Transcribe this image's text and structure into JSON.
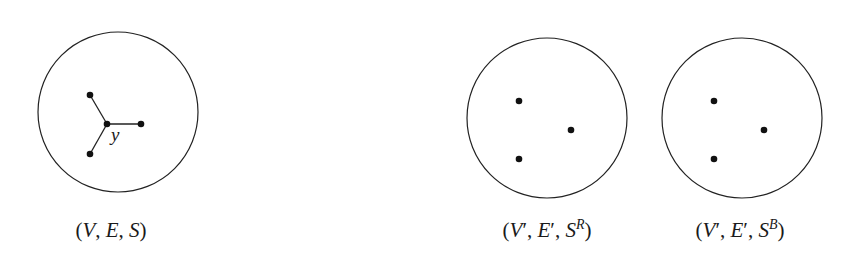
{
  "canvas": {
    "width": 867,
    "height": 258,
    "background": "#ffffff"
  },
  "colors": {
    "stroke": "#222222",
    "vertex": "#111111",
    "text": "#1a1a1a"
  },
  "panels": [
    {
      "id": "original",
      "circle": {
        "cx": 118,
        "cy": 112,
        "r": 80
      },
      "vertices": [
        {
          "id": "a",
          "x": 90,
          "y": 95
        },
        {
          "id": "y",
          "x": 107,
          "y": 124
        },
        {
          "id": "b",
          "x": 141,
          "y": 124
        },
        {
          "id": "c",
          "x": 90,
          "y": 154
        }
      ],
      "edges": [
        [
          "y",
          "a"
        ],
        [
          "y",
          "b"
        ],
        [
          "y",
          "c"
        ]
      ],
      "vertex_labels": [
        {
          "vertex": "y",
          "text": "y",
          "x": 111,
          "y": 141
        }
      ],
      "caption": {
        "open": "(",
        "V": "V",
        "sep1": ", ",
        "E": "E",
        "sep2": ", ",
        "S": "S",
        "close": ")",
        "full": "(V, E, S)",
        "x": 111,
        "y": 237
      }
    },
    {
      "id": "red",
      "circle": {
        "cx": 547,
        "cy": 118,
        "r": 80
      },
      "vertices": [
        {
          "id": "a",
          "x": 519,
          "y": 101
        },
        {
          "id": "b",
          "x": 571,
          "y": 130
        },
        {
          "id": "c",
          "x": 519,
          "y": 159
        }
      ],
      "edges": [],
      "caption": {
        "open": "(",
        "V": "V",
        "prime": "′",
        "sep1": ", ",
        "E": "E",
        "sep2": ", ",
        "S": "S",
        "sup": "R",
        "close": ")",
        "full": "(V′, E′, S^R)",
        "x": 547,
        "y": 237
      }
    },
    {
      "id": "blue",
      "circle": {
        "cx": 742,
        "cy": 118,
        "r": 80
      },
      "vertices": [
        {
          "id": "a",
          "x": 714,
          "y": 101
        },
        {
          "id": "b",
          "x": 764,
          "y": 130
        },
        {
          "id": "c",
          "x": 714,
          "y": 159
        }
      ],
      "edges": [],
      "caption": {
        "open": "(",
        "V": "V",
        "prime": "′",
        "sep1": ", ",
        "E": "E",
        "sep2": ", ",
        "S": "S",
        "sup": "B",
        "close": ")",
        "full": "(V′, E′, S^B)",
        "x": 740,
        "y": 237
      }
    }
  ]
}
